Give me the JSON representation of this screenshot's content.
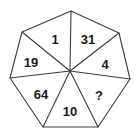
{
  "figure": {
    "shape": "heptagon",
    "sector_count": 7,
    "stroke_color": "#3c3c3c",
    "fill_color": "#ffffff",
    "text_color": "#1a1a1a",
    "background_color": "#ffffff"
  },
  "sectors": [
    {
      "id": "sector-top-left",
      "label": "1",
      "x": 55,
      "y": 41
    },
    {
      "id": "sector-top-right",
      "label": "31",
      "x": 88,
      "y": 41
    },
    {
      "id": "sector-right",
      "label": "4",
      "x": 105,
      "y": 66
    },
    {
      "id": "sector-bottom-right",
      "label": "?",
      "x": 99,
      "y": 97
    },
    {
      "id": "sector-bottom",
      "label": "10",
      "x": 70,
      "y": 113
    },
    {
      "id": "sector-bottom-left",
      "label": "64",
      "x": 41,
      "y": 96
    },
    {
      "id": "sector-left",
      "label": "19",
      "x": 31,
      "y": 64
    }
  ],
  "geometry": {
    "center": {
      "x": 70,
      "y": 71
    },
    "vertices": [
      {
        "name": "vertex-top",
        "x": 71,
        "y": 11
      },
      {
        "name": "vertex-upper-right",
        "x": 119,
        "y": 33
      },
      {
        "name": "vertex-lower-right",
        "x": 130,
        "y": 79
      },
      {
        "name": "vertex-bottom-right",
        "x": 98,
        "y": 127
      },
      {
        "name": "vertex-bottom-left",
        "x": 43,
        "y": 127
      },
      {
        "name": "vertex-lower-left",
        "x": 10,
        "y": 78
      },
      {
        "name": "vertex-upper-left",
        "x": 22,
        "y": 32
      }
    ]
  }
}
